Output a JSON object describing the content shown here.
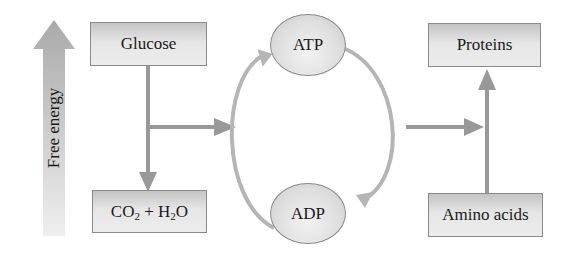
{
  "diagram": {
    "energy_axis": {
      "label": "Free energy",
      "direction": "up"
    },
    "nodes": {
      "glucose": {
        "label": "Glucose"
      },
      "co2_h2o": {
        "parts": [
          "CO",
          "2",
          " + H",
          "2",
          "O"
        ],
        "label": "CO2 + H2O"
      },
      "atp": {
        "label": "ATP"
      },
      "adp": {
        "label": "ADP"
      },
      "proteins": {
        "label": "Proteins"
      },
      "amino_acids": {
        "label": "Amino acids"
      }
    },
    "edges": [
      {
        "from": "Glucose",
        "to": "CO2 + H2O"
      },
      {
        "from": "Glucose breakdown",
        "to": "ADP → ATP cycle"
      },
      {
        "from": "ADP",
        "to": "ATP"
      },
      {
        "from": "ATP",
        "to": "ADP"
      },
      {
        "from": "ATP → ADP cycle",
        "to": "Protein synthesis"
      },
      {
        "from": "Amino acids",
        "to": "Proteins"
      }
    ],
    "colors": {
      "arrow": "#999999",
      "loop": "#b3b3b3",
      "energy_arrow_top": "#a9a9a9",
      "energy_arrow_bottom": "#eeeeee",
      "box_border": "#8a8a8a",
      "text": "#1a1a1a"
    }
  }
}
